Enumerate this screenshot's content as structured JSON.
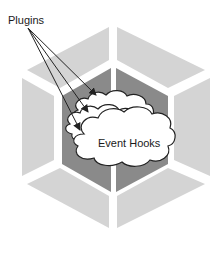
{
  "diagram": {
    "labels": {
      "plugins": "Plugins",
      "event_hooks": "Event Hooks"
    },
    "colors": {
      "outer_segment": "#d4d4d4",
      "inner_core": "#8a8a8a",
      "gap": "#ffffff",
      "cloud_fill": "#ffffff",
      "cloud_stroke": "#222222",
      "arrow": "#222222"
    },
    "elements": {
      "outer_segments": [
        "top-left",
        "top-right",
        "right",
        "bottom-right",
        "bottom-left",
        "left"
      ],
      "inner_core_halves": [
        "left-half",
        "right-half"
      ],
      "clouds": [
        "back-cloud",
        "middle-cloud",
        "front-cloud"
      ],
      "arrows": [
        {
          "from": "Plugins",
          "to": "back-cloud"
        },
        {
          "from": "Plugins",
          "to": "middle-cloud"
        },
        {
          "from": "Plugins",
          "to": "front-cloud"
        }
      ]
    }
  }
}
